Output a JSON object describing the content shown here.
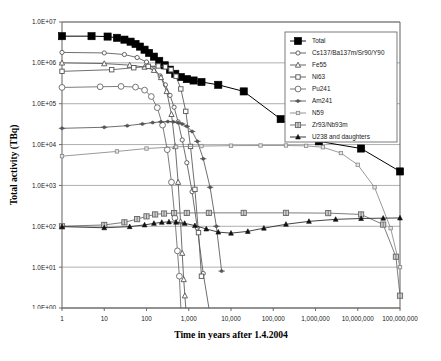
{
  "chart_data": {
    "type": "line",
    "title": "",
    "xlabel": "Time in years after 1.4.2004",
    "ylabel": "Total activity (TBq)",
    "xscale": "log",
    "yscale": "log",
    "xlim": [
      1,
      100000000
    ],
    "ylim": [
      1,
      10000000
    ],
    "grid": true,
    "legend_position": "top-right",
    "xticklabels": [
      "1",
      "10",
      "100",
      "1,000",
      "10,000",
      "100,000",
      "1,000,000",
      "10,000,000",
      "100,000,000"
    ],
    "xtickvalues": [
      1,
      10,
      100,
      1000,
      10000,
      100000,
      1000000,
      10000000,
      100000000
    ],
    "yticklabels": [
      "1.0E+00",
      "1.0E+01",
      "1.0E+02",
      "1.0E+03",
      "1.0E+04",
      "1.0E+05",
      "1.0E+06",
      "1.0E+07"
    ],
    "ytickvalues": [
      1,
      10,
      100,
      1000,
      10000,
      100000,
      1000000,
      10000000
    ],
    "series": [
      {
        "name": "Total",
        "marker": "filled-square",
        "color": "#000000",
        "x": [
          1,
          5,
          12,
          20,
          30,
          42,
          55,
          70,
          90,
          115,
          150,
          200,
          270,
          360,
          480,
          650,
          900,
          1300,
          2000,
          5000,
          20000,
          150000,
          1200000,
          12000000,
          100000000
        ],
        "y": [
          4500000,
          4500000,
          4400000,
          4100000,
          3700000,
          3300000,
          2900000,
          2500000,
          2100000,
          1750000,
          1420000,
          1120000,
          870000,
          680000,
          540000,
          450000,
          400000,
          370000,
          340000,
          290000,
          200000,
          42000,
          12000,
          8000,
          2200
        ]
      },
      {
        "name": "Cs137/Ba137m/Sr90/Y90",
        "marker": "open-circle-small",
        "color": "#555555",
        "x": [
          1,
          10,
          30,
          60,
          100,
          150,
          210,
          280,
          360,
          450,
          560,
          700,
          900,
          1200,
          1600,
          2200,
          3000
        ],
        "y": [
          1800000,
          1750000,
          1600000,
          1350000,
          1050000,
          730000,
          480000,
          290000,
          160000,
          82000,
          36000,
          13000,
          3600,
          700,
          90,
          7,
          1
        ]
      },
      {
        "name": "Fe55",
        "marker": "open-triangle-small",
        "color": "#555555",
        "x": [
          1,
          10,
          40,
          90,
          150,
          220,
          300,
          390,
          480,
          560,
          640,
          700,
          760,
          810,
          850
        ],
        "y": [
          1000000,
          960000,
          880000,
          790000,
          660000,
          440000,
          200000,
          55000,
          9000,
          1200,
          130,
          22,
          5,
          2,
          1
        ]
      },
      {
        "name": "Ni63",
        "marker": "open-square-small",
        "color": "#555555",
        "x": [
          1,
          15,
          50,
          110,
          190,
          280,
          380,
          500,
          650,
          850,
          1100,
          1400,
          1700,
          2000
        ],
        "y": [
          620000,
          680000,
          760000,
          820000,
          840000,
          800000,
          680000,
          470000,
          230000,
          65000,
          9000,
          800,
          70,
          6
        ]
      },
      {
        "name": "Pu241",
        "marker": "open-circle",
        "color": "#666666",
        "x": [
          1,
          8,
          25,
          55,
          90,
          130,
          180,
          240,
          310,
          390,
          470,
          540,
          600,
          650
        ],
        "y": [
          250000,
          260000,
          265000,
          255000,
          215000,
          150000,
          80000,
          30000,
          7500,
          1200,
          160,
          25,
          6,
          1
        ]
      },
      {
        "name": "Am241",
        "marker": "plus-dot",
        "color": "#555555",
        "x": [
          1,
          10,
          35,
          80,
          140,
          220,
          320,
          430,
          560,
          700,
          900,
          1200,
          1600,
          2200,
          3200,
          4500,
          6000
        ],
        "y": [
          25000,
          26500,
          29000,
          32000,
          34500,
          36000,
          36500,
          36000,
          34500,
          32000,
          28000,
          21000,
          12000,
          4500,
          900,
          100,
          8
        ]
      },
      {
        "name": "Ni59",
        "marker": "open-square-tiny",
        "color": "#888888",
        "x": [
          1,
          20,
          100,
          500,
          2000,
          10000,
          50000,
          200000,
          600000,
          1500000,
          4000000,
          10000000,
          25000000,
          60000000,
          100000000
        ],
        "y": [
          5200,
          6800,
          8000,
          8800,
          9200,
          9400,
          9500,
          9500,
          9300,
          8600,
          6200,
          3200,
          900,
          90,
          10
        ]
      },
      {
        "name": "Zr93/Nb93m",
        "marker": "crossed-square",
        "color": "#666666",
        "x": [
          1,
          10,
          30,
          60,
          100,
          160,
          260,
          450,
          900,
          3000,
          20000,
          200000,
          2000000,
          12000000,
          40000000,
          80000000,
          100000000
        ],
        "y": [
          100,
          108,
          125,
          150,
          175,
          195,
          205,
          210,
          212,
          213,
          213,
          213,
          210,
          195,
          110,
          18,
          2
        ]
      },
      {
        "name": "U238 and daughters",
        "marker": "filled-triangle",
        "color": "#222222",
        "x": [
          1,
          10,
          40,
          90,
          150,
          230,
          340,
          500,
          800,
          1400,
          2600,
          5000,
          10000,
          25000,
          60000,
          200000,
          700000,
          3000000,
          12000000,
          40000000,
          100000000
        ],
        "y": [
          98,
          92,
          98,
          108,
          118,
          125,
          128,
          126,
          118,
          104,
          86,
          72,
          68,
          75,
          90,
          112,
          132,
          148,
          155,
          158,
          160
        ]
      }
    ]
  },
  "legend": {
    "items": [
      {
        "label": "Total"
      },
      {
        "label": "Cs137/Ba137m/Sr90/Y90"
      },
      {
        "label": "Fe55"
      },
      {
        "label": "Ni63"
      },
      {
        "label": "Pu241"
      },
      {
        "label": "Am241"
      },
      {
        "label": "N59"
      },
      {
        "label": "Zr93/Nb93m"
      },
      {
        "label": "U238 and daughters"
      }
    ]
  },
  "colors": {
    "frame": "#6e6e6e",
    "grid": "#9a9a9a",
    "text": "#1a1a1a",
    "background": "#ffffff"
  }
}
